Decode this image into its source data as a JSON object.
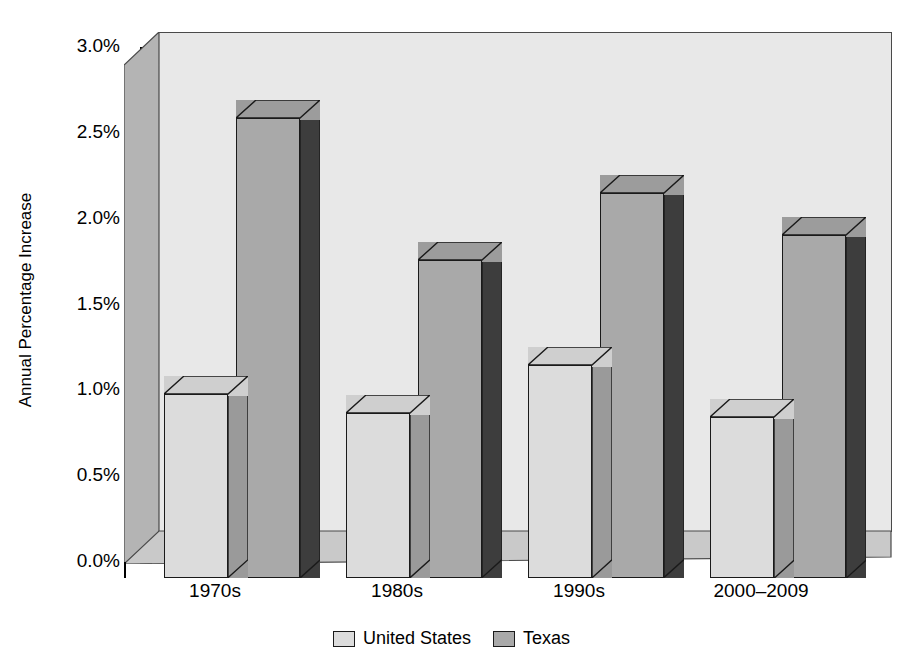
{
  "chart_data": {
    "type": "bar",
    "title": "",
    "subtitle": "",
    "xlabel": "",
    "ylabel": "Annual Percentage Increase",
    "categories": [
      "1970s",
      "1980s",
      "1990s",
      "2000–2009"
    ],
    "series": [
      {
        "name": "United States",
        "values": [
          1.07,
          0.96,
          1.24,
          0.94
        ],
        "color": "#dcdcdc"
      },
      {
        "name": "Texas",
        "values": [
          2.68,
          1.85,
          2.24,
          2.0
        ],
        "color": "#a9a9a9"
      }
    ],
    "ylim": [
      0,
      3.0
    ],
    "ytick_values": [
      0.0,
      0.5,
      1.0,
      1.5,
      2.0,
      2.5,
      3.0
    ],
    "ytick_labels": [
      "0.0%",
      "0.5%",
      "1.0%",
      "1.5%",
      "2.0%",
      "2.5%",
      "3.0%"
    ],
    "grid": false,
    "legend_position": "bottom",
    "style": "3d-grouped-bars"
  },
  "axis": {
    "y_title": "Annual Percentage Increase"
  },
  "legend": {
    "items": [
      {
        "label": "United States",
        "swatch": "light-gray-swatch"
      },
      {
        "label": "Texas",
        "swatch": "medium-gray-swatch"
      }
    ]
  },
  "colors": {
    "back_wall": "#e8e8e8",
    "left_wall": "#b4b4b4",
    "floor": "#c9c9c9",
    "us_face": "#dcdcdc",
    "us_side": "#9a9a9a",
    "tx_face": "#a9a9a9",
    "tx_side": "#3d3d3d",
    "outline": "#1a1a1a"
  }
}
